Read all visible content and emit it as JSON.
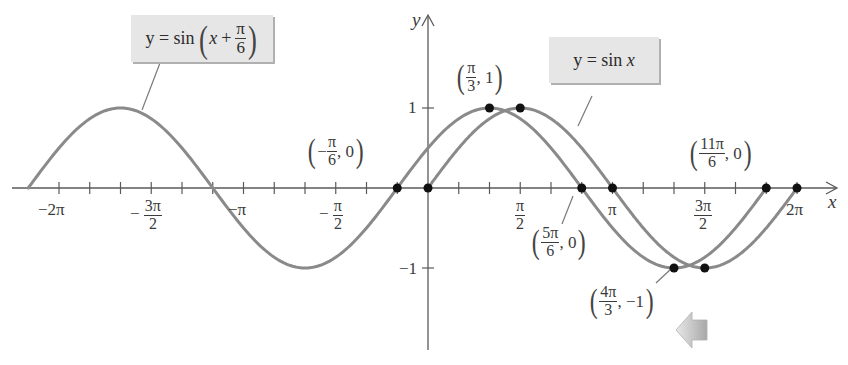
{
  "chart_data": {
    "type": "line",
    "title": "",
    "xlabel": "x",
    "ylabel": "y",
    "xlim": [
      -6.6,
      6.8
    ],
    "ylim": [
      -1.95,
      2.2
    ],
    "grid": false,
    "x_tick_labels": [
      "-2π",
      "-3π/2",
      "-π",
      "-π/2",
      "π/2",
      "π",
      "3π/2",
      "2π"
    ],
    "x_tick_values": [
      -6.2832,
      -4.7124,
      -3.1416,
      -1.5708,
      1.5708,
      3.1416,
      4.7124,
      6.2832
    ],
    "x_minor_tick_step": "π/6",
    "y_tick_labels": [
      "1",
      "-1"
    ],
    "y_tick_values": [
      1,
      -1
    ],
    "series": [
      {
        "name": "y = sin x",
        "function": "sin(x)",
        "domain": [
          0,
          6.2832
        ],
        "color": "#8a8a8a"
      },
      {
        "name": "y = sin(x + π/6)",
        "function": "sin(x + π/6)",
        "domain": [
          -6.8068,
          5.7596
        ],
        "color": "#8a8a8a"
      }
    ],
    "marked_points": [
      {
        "label": "(-π/6, 0)",
        "x": -0.5236,
        "y": 0,
        "series": "y = sin(x + π/6)"
      },
      {
        "label": "(0, 0)",
        "x": 0,
        "y": 0,
        "series": "y = sin x"
      },
      {
        "label": "(π/3, 1)",
        "x": 1.0472,
        "y": 1,
        "series": "y = sin(x + π/6)"
      },
      {
        "label": "(π/2, 1)",
        "x": 1.5708,
        "y": 1,
        "series": "y = sin x"
      },
      {
        "label": "(5π/6, 0)",
        "x": 2.618,
        "y": 0,
        "series": "y = sin(x + π/6)"
      },
      {
        "label": "(π, 0)",
        "x": 3.1416,
        "y": 0,
        "series": "y = sin x"
      },
      {
        "label": "(4π/3, -1)",
        "x": 4.1888,
        "y": -1,
        "series": "y = sin(x + π/6)"
      },
      {
        "label": "(3π/2, -1)",
        "x": 4.7124,
        "y": -1,
        "series": "y = sin x"
      },
      {
        "label": "(11π/6, 0)",
        "x": 5.7596,
        "y": 0,
        "series": "y = sin(x + π/6)"
      },
      {
        "label": "(2π, 0)",
        "x": 6.2832,
        "y": 0,
        "series": "y = sin x"
      }
    ],
    "annotations": [
      "y = sin(x + π/6)",
      "y = sin x",
      "(-π/6, 0)",
      "(π/3, 1)",
      "(5π/6, 0)",
      "(4π/3, -1)",
      "(11π/6, 0)"
    ],
    "shift_arrow": {
      "direction": "left",
      "meaning": "shift left by π/6"
    }
  },
  "labels": {
    "x_axis": "x",
    "y_axis": "y",
    "callout_shifted": {
      "prefix": "y = sin",
      "var": "x",
      "plus": "+",
      "num": "π",
      "den": "6"
    },
    "callout_base": {
      "text": "y = sin",
      "var": "x"
    },
    "ticks": {
      "neg2pi": "−2π",
      "neg3pi2_num": "3π",
      "neg3pi2_den": "2",
      "negpi": "−π",
      "negpi2_num": "π",
      "negpi2_den": "2",
      "pi2_num": "π",
      "pi2_den": "2",
      "pi": "π",
      "threepi2_num": "3π",
      "threepi2_den": "2",
      "twopi": "2π",
      "minus": "−",
      "y1": "1",
      "yneg1": "−1"
    },
    "pt_neg_pi6": {
      "sign": "−",
      "num": "π",
      "den": "6",
      "y": ", 0"
    },
    "pt_pi3": {
      "num": "π",
      "den": "3",
      "y": ", 1"
    },
    "pt_5pi6": {
      "num": "5π",
      "den": "6",
      "y": ", 0"
    },
    "pt_4pi3": {
      "num": "4π",
      "den": "3",
      "y": ", −1"
    },
    "pt_11pi6": {
      "num": "11π",
      "den": "6",
      "y": ", 0"
    }
  },
  "colors": {
    "curve": "#8a8a8a",
    "axis": "#5a5a5a",
    "point": "#111111",
    "callout_bg": "#e6e6e6",
    "arrow": "#c4c4c4"
  }
}
